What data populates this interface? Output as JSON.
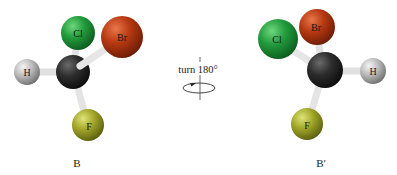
{
  "diagram": {
    "left_molecule": {
      "caption": "B",
      "atoms": {
        "cl": {
          "label": "Cl",
          "color": "#1f9a3a"
        },
        "br": {
          "label": "Br",
          "color": "#b83a12"
        },
        "h": {
          "label": "H",
          "color": "#bdbdbd"
        },
        "c": {
          "label": "",
          "color": "#2a2a2a"
        },
        "f": {
          "label": "F",
          "color": "#a8ad2a"
        }
      }
    },
    "rotation": {
      "label": "turn 180°"
    },
    "right_molecule": {
      "caption": "B′",
      "atoms": {
        "cl": {
          "label": "Cl",
          "color": "#1f9a3a"
        },
        "br": {
          "label": "Br",
          "color": "#b83a12"
        },
        "h": {
          "label": "H",
          "color": "#bdbdbd"
        },
        "c": {
          "label": "",
          "color": "#2a2a2a"
        },
        "f": {
          "label": "F",
          "color": "#a8ad2a"
        }
      }
    }
  }
}
